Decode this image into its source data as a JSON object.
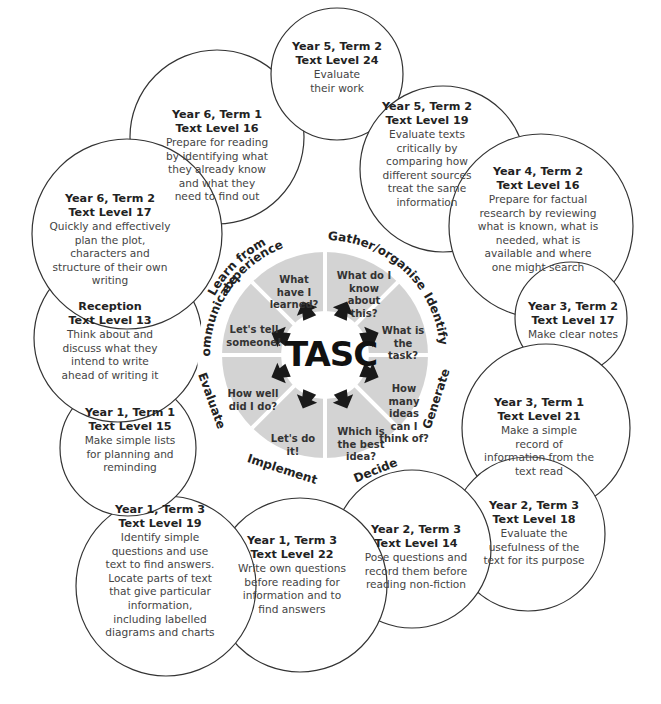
{
  "hub": {
    "label": "TASC"
  },
  "wheel": {
    "fill_color": "#d3d3d3",
    "stages": [
      {
        "name": "Gather/organise",
        "question": "What do I know about this?"
      },
      {
        "name": "Identify",
        "question": "What is the task?"
      },
      {
        "name": "Generate",
        "question": "How many ideas can I think of?"
      },
      {
        "name": "Decide",
        "question": "Which is the best idea?"
      },
      {
        "name": "Implement",
        "question": "Let's do it!"
      },
      {
        "name": "Evaluate",
        "question": "How well did I do?"
      },
      {
        "name": "Communicate",
        "question": "Let's tell someone!"
      },
      {
        "name": "Learn from experience",
        "question": "What have I learned?"
      }
    ]
  },
  "objectives": [
    {
      "year_term": "Year 5, Term 2",
      "level": "Text Level 24",
      "description": "Evaluate their work"
    },
    {
      "year_term": "Year 5, Term 2",
      "level": "Text Level 19",
      "description": "Evaluate texts critically by comparing how different sources treat the same information"
    },
    {
      "year_term": "Year 4, Term 2",
      "level": "Text Level 16",
      "description": "Prepare for factual research by reviewing what is known, what is needed, what is available and where one might search"
    },
    {
      "year_term": "Year 3, Term 2",
      "level": "Text Level 17",
      "description": "Make clear notes"
    },
    {
      "year_term": "Year 3, Term 1",
      "level": "Text Level 21",
      "description": "Make a simple record of information from the text read"
    },
    {
      "year_term": "Year 2, Term 3",
      "level": "Text Level 18",
      "description": "Evaluate the usefulness of the text for its purpose"
    },
    {
      "year_term": "Year 2, Term 3",
      "level": "Text Level 14",
      "description": "Pose questions and record them before reading non-fiction"
    },
    {
      "year_term": "Year 1, Term 3",
      "level": "Text Level 22",
      "description": "Write own questions before reading for information and to find answers"
    },
    {
      "year_term": "Year 1, Term 3",
      "level": "Text Level 19",
      "description": "Identify simple questions and use text to find answers. Locate parts of text that give particular information, including labelled diagrams and charts"
    },
    {
      "year_term": "Year 1, Term 1",
      "level": "Text Level 15",
      "description": "Make simple lists for planning and reminding"
    },
    {
      "year_term": "Reception",
      "level": "Text Level 13",
      "description": "Think about and discuss what they intend to write ahead of writing it"
    },
    {
      "year_term": "Year 6, Term 2",
      "level": "Text Level 17",
      "description": "Quickly and effectively plan the plot, characters and structure of their own writing"
    },
    {
      "year_term": "Year 6, Term 1",
      "level": "Text Level 16",
      "description": "Prepare for reading by identifying what they already know and what they need to find out"
    }
  ]
}
